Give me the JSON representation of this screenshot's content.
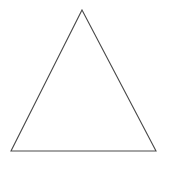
{
  "figure": {
    "name": "triangle-line-drawing",
    "background_color": "#ffffff",
    "canvas": {
      "width": 178,
      "height": 170
    },
    "shape": {
      "kind": "triangle",
      "description": "isosceles triangle outline",
      "stroke_color": "#4a4a4a",
      "stroke_width": 1.1,
      "fill": "none",
      "closed": true,
      "vertices": [
        {
          "label": "apex",
          "x": 82,
          "y": 10
        },
        {
          "label": "bottom-right",
          "x": 156,
          "y": 151
        },
        {
          "label": "bottom-left",
          "x": 11,
          "y": 151
        }
      ],
      "points_attr": "82,10 156,151 11,151",
      "base_length_px": 145,
      "height_px": 141
    },
    "labels": [],
    "annotations": []
  }
}
